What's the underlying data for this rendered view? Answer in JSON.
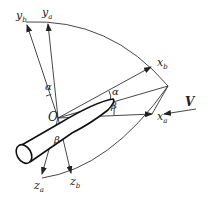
{
  "diagram": {
    "labels": {
      "yb": {
        "main": "y",
        "sub": "b"
      },
      "ya": {
        "main": "y",
        "sub": "a"
      },
      "xb": {
        "main": "x",
        "sub": "b"
      },
      "xa": {
        "main": "x",
        "sub": "a"
      },
      "za": {
        "main": "z",
        "sub": "a"
      },
      "zb": {
        "main": "z",
        "sub": "b"
      },
      "origin": "O",
      "velocity": "V",
      "alpha_top": "α",
      "alpha_right": "α",
      "beta_right": "β",
      "beta_bottom": "β"
    },
    "colors": {
      "stroke": "#222222",
      "background": "#ffffff"
    }
  }
}
